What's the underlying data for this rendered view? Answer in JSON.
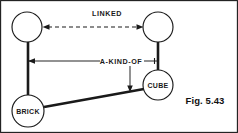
{
  "figure": {
    "caption": "Fig. 5.43",
    "width": 238,
    "height": 133,
    "background": "#ffffff",
    "ink_color": "#1a1a1a"
  },
  "nodes": [
    {
      "id": "top-left",
      "label": "",
      "cx": 27,
      "cy": 27,
      "r": 15
    },
    {
      "id": "top-right",
      "label": "",
      "cx": 158,
      "cy": 27,
      "r": 15
    },
    {
      "id": "brick",
      "label": "BRICK",
      "cx": 28,
      "cy": 111,
      "r": 16
    },
    {
      "id": "cube",
      "label": "CUBE",
      "cx": 158,
      "cy": 85,
      "r": 15
    }
  ],
  "edges": [
    {
      "id": "linked",
      "label": "LINKED",
      "style": "dashed",
      "arrowheads": "both",
      "from": "top-left",
      "to": "top-right"
    },
    {
      "id": "a-kind-of",
      "label": "A-KIND-OF",
      "style": "thin",
      "arrowheads": "left",
      "from": "top-right",
      "to": "top-left"
    },
    {
      "id": "a-kind-of-branch",
      "label": "",
      "style": "thin",
      "arrowheads": "down",
      "from": "a-kind-of",
      "to": "cube-brick-link"
    },
    {
      "id": "instance-left",
      "label": "",
      "style": "thick",
      "arrowheads": "none",
      "from": "top-left",
      "to": "brick"
    },
    {
      "id": "instance-right",
      "label": "",
      "style": "thick",
      "arrowheads": "none",
      "from": "top-right",
      "to": "cube"
    },
    {
      "id": "cube-brick-link",
      "label": "",
      "style": "thick",
      "arrowheads": "none",
      "from": "cube",
      "to": "brick"
    }
  ],
  "labels": {
    "linked": "LINKED",
    "a_kind_of": "A-KIND-OF",
    "brick": "BRICK",
    "cube": "CUBE",
    "caption": "Fig. 5.43"
  }
}
